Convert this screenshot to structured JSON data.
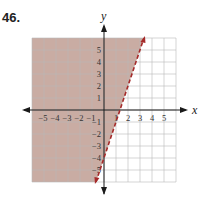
{
  "problem_number": "46.",
  "chart_data": {
    "type": "line",
    "title": "",
    "xlabel": "x",
    "ylabel": "y",
    "xlim": [
      -6,
      6
    ],
    "ylim": [
      -6,
      6
    ],
    "grid": true,
    "x_ticks": [
      -5,
      -4,
      -3,
      -2,
      -1,
      1,
      2,
      3,
      4,
      5
    ],
    "y_ticks": [
      5,
      4,
      3,
      2,
      1,
      -1,
      -2,
      -3,
      -4,
      -5
    ],
    "series": [
      {
        "name": "boundary line y = 3x - 4",
        "style": "dashed",
        "color": "#a52a2a",
        "points": [
          [
            -0.67,
            -6
          ],
          [
            3.33,
            6
          ]
        ],
        "slope": 3,
        "intercept": -4
      }
    ],
    "shaded_region": {
      "inequality": "y > 3x - 4",
      "side": "left/above line",
      "color": "#c9aca3"
    }
  },
  "colors": {
    "shade": "#c9aca3",
    "grid": "#b9b9b9",
    "axis": "#1a1a1a",
    "line": "#a52a2a"
  }
}
